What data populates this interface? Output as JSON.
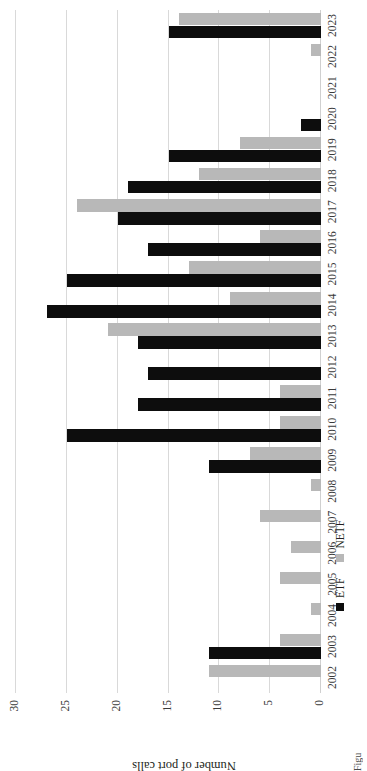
{
  "figure": {
    "caption": "Figure 2. Annual Port Calls 2002-2023",
    "axis_title_y": "Number of port calls",
    "legend_position": "bottom-left"
  },
  "legend": {
    "entries": [
      {
        "label": "ETF",
        "color": "#0d0d0d"
      },
      {
        "label": "NETF",
        "color": "#b8b8b8"
      }
    ]
  },
  "chart_data": {
    "type": "bar",
    "title": "",
    "xlabel": "",
    "ylabel": "Number of port calls",
    "ylim": [
      0,
      30
    ],
    "yticks": [
      0,
      5,
      10,
      15,
      20,
      25,
      30
    ],
    "ytick_labels": [
      "0",
      "5",
      "10",
      "15",
      "20",
      "25",
      "30"
    ],
    "grid": true,
    "orientation": "rotated-90",
    "categories": [
      "2002",
      "2003",
      "2004",
      "2005",
      "2006",
      "2007",
      "2008",
      "2009",
      "2010",
      "2011",
      "2012",
      "2013",
      "2014",
      "2015",
      "2016",
      "2017",
      "2018",
      "2019",
      "2020",
      "2021",
      "2022",
      "2023"
    ],
    "series": [
      {
        "name": "ETF",
        "color": "#0d0d0d",
        "values": [
          0,
          11,
          0,
          0,
          0,
          0,
          0,
          11,
          25,
          18,
          17,
          18,
          27,
          25,
          17,
          20,
          19,
          15,
          2,
          0,
          0,
          15
        ]
      },
      {
        "name": "NETF",
        "color": "#b8b8b8",
        "values": [
          11,
          4,
          1,
          4,
          3,
          6,
          1,
          7,
          4,
          4,
          0,
          21,
          9,
          13,
          6,
          24,
          12,
          8,
          0,
          0,
          1,
          14
        ]
      }
    ]
  }
}
